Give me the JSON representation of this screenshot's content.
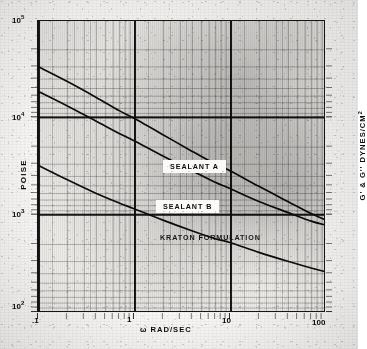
{
  "chart_data": {
    "type": "line",
    "title": "",
    "subtitle": "",
    "xlabel": "ω RAD/SEC",
    "ylabel": "POISE",
    "ylabel_right": "G' & G'' DYNES/CM2",
    "ylabel_right_base": "G' & G'' DYNES/CM",
    "ylabel_right_exp": "2",
    "xscale": "log",
    "yscale": "log",
    "xlim": [
      0.1,
      100
    ],
    "ylim": [
      100,
      100000
    ],
    "grid": true,
    "legend_position": "inline-on-curves",
    "x_tick_labels": [
      ".1",
      "1",
      "10",
      "100"
    ],
    "x_tick_values": [
      0.1,
      1,
      10,
      100
    ],
    "y_tick_labels": [
      "10^5",
      "10^4",
      "10^3",
      "10^2"
    ],
    "y_tick_values": [
      100000,
      10000,
      1000,
      100
    ],
    "y_tick_base": "10",
    "y_tick_exps": [
      "5",
      "4",
      "3",
      "2"
    ],
    "series": [
      {
        "name": "SEALANT A",
        "label": "SEALANT A",
        "x": [
          0.1,
          0.2,
          0.4,
          0.7,
          1.0,
          2.0,
          4.0,
          7.0,
          10.0,
          20.0,
          40.0,
          70.0,
          100.0
        ],
        "y": [
          34000,
          24000,
          16500,
          12000,
          10000,
          6800,
          4600,
          3400,
          2900,
          2000,
          1400,
          1050,
          900
        ]
      },
      {
        "name": "SEALANT B",
        "label": "SEALANT B",
        "x": [
          0.1,
          0.2,
          0.4,
          0.7,
          1.0,
          2.0,
          4.0,
          7.0,
          10.0,
          20.0,
          40.0,
          70.0,
          100.0
        ],
        "y": [
          19000,
          13500,
          9400,
          7000,
          5900,
          4100,
          2900,
          2200,
          1900,
          1400,
          1080,
          880,
          800
        ]
      },
      {
        "name": "KRATON FORMULATION",
        "label": "KRATON FORMULATION",
        "x": [
          0.1,
          0.2,
          0.4,
          0.7,
          1.0,
          2.0,
          4.0,
          7.0,
          10.0,
          20.0,
          40.0,
          70.0,
          100.0
        ],
        "y": [
          3300,
          2350,
          1700,
          1350,
          1180,
          900,
          700,
          580,
          530,
          420,
          340,
          290,
          265
        ]
      }
    ]
  },
  "axes": {
    "x_ticks": [
      {
        "id": "xt-01",
        "label": ".1"
      },
      {
        "id": "xt-1",
        "label": "1"
      },
      {
        "id": "xt-10",
        "label": "10"
      },
      {
        "id": "xt-100",
        "label": "100"
      }
    ],
    "y_ticks": [
      {
        "id": "yt-5",
        "base": "10",
        "exp": "5"
      },
      {
        "id": "yt-4",
        "base": "10",
        "exp": "4"
      },
      {
        "id": "yt-3",
        "base": "10",
        "exp": "3"
      },
      {
        "id": "yt-2",
        "base": "10",
        "exp": "2"
      }
    ]
  },
  "labels": {
    "sealant_a": "SEALANT A",
    "sealant_b": "SEALANT B",
    "kraton": "KRATON FORMULATION",
    "x_axis": "ω RAD/SEC",
    "y_axis_left": "POISE",
    "y_axis_right_base": "G' & G'' DYNES/CM",
    "y_axis_right_exp": "2"
  },
  "colors": {
    "curve": "#121212",
    "grid_major": "#0f0f0f",
    "grid_minor": "#1e1e1e",
    "paper": "#f2f1ef",
    "plot_bg": "#eceae7"
  }
}
